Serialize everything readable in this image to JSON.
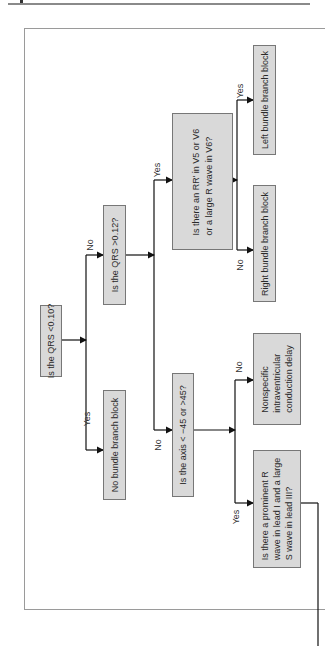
{
  "flowchart": {
    "nodes": {
      "qrs_lt_010": "Is the QRS <0.10?",
      "no_bbb": "No bundle branch block",
      "qrs_gt_012": "Is the QRS >0.12?",
      "rr_prime": [
        "Is there an RR' in V5 or V6",
        "or a large R wave in V6?"
      ],
      "lbbb": "Left bundle branch block",
      "rbbb": "Right bundle branch block",
      "axis": "Is the axis < −45 or >45?",
      "nonspecific": [
        "Nonspecific",
        "intraventricular",
        "conduction delay"
      ],
      "prominent_r": [
        "Is there a prominent R",
        "wave in lead I and a large",
        "S wave in lead III?"
      ]
    },
    "edge_labels": {
      "yes": "Yes",
      "no": "No"
    }
  }
}
